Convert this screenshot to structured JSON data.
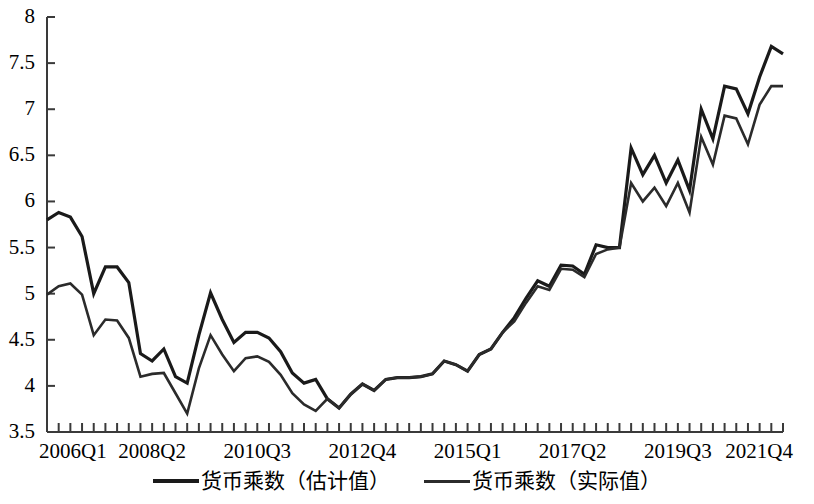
{
  "chart_data": {
    "type": "line",
    "title": "",
    "xlabel": "",
    "ylabel": "",
    "ylim": [
      3.5,
      8
    ],
    "ytick_labels": [
      "8",
      "7.5",
      "7",
      "6.5",
      "6",
      "5.5",
      "5",
      "4.5",
      "4",
      "3.5"
    ],
    "ytick_values": [
      8,
      7.5,
      7,
      6.5,
      6,
      5.5,
      5,
      4.5,
      4,
      3.5
    ],
    "grid": false,
    "legend_position": "bottom-center",
    "x": [
      "2006Q1",
      "2006Q2",
      "2006Q3",
      "2006Q4",
      "2007Q1",
      "2007Q2",
      "2007Q3",
      "2007Q4",
      "2008Q1",
      "2008Q2",
      "2008Q3",
      "2008Q4",
      "2009Q1",
      "2009Q2",
      "2009Q3",
      "2009Q4",
      "2010Q1",
      "2010Q2",
      "2010Q3",
      "2010Q4",
      "2011Q1",
      "2011Q2",
      "2011Q3",
      "2011Q4",
      "2012Q1",
      "2012Q2",
      "2012Q3",
      "2012Q4",
      "2013Q1",
      "2013Q2",
      "2013Q3",
      "2013Q4",
      "2014Q1",
      "2014Q2",
      "2014Q3",
      "2014Q4",
      "2015Q1",
      "2015Q2",
      "2015Q3",
      "2015Q4",
      "2016Q1",
      "2016Q2",
      "2016Q3",
      "2016Q4",
      "2017Q1",
      "2017Q2",
      "2017Q3",
      "2017Q4",
      "2018Q1",
      "2018Q2",
      "2018Q3",
      "2018Q4",
      "2019Q1",
      "2019Q2",
      "2019Q3",
      "2019Q4",
      "2020Q1",
      "2020Q2",
      "2020Q3",
      "2020Q4",
      "2021Q1",
      "2021Q2",
      "2021Q3",
      "2021Q4"
    ],
    "xtick_labels": [
      "2006Q1",
      "2008Q2",
      "2010Q3",
      "2012Q4",
      "2015Q1",
      "2017Q2",
      "2019Q3",
      "2021Q4"
    ],
    "xtick_indices": [
      0,
      9,
      18,
      27,
      36,
      45,
      54,
      63
    ],
    "series": [
      {
        "name": "货币乘数（估计值）",
        "color": "#1a1a1a",
        "width": 3.2,
        "values": [
          5.8,
          5.88,
          5.83,
          5.62,
          5.0,
          5.29,
          5.29,
          5.12,
          4.35,
          4.27,
          4.4,
          4.1,
          4.03,
          4.55,
          5.01,
          4.72,
          4.47,
          4.58,
          4.58,
          4.52,
          4.37,
          4.14,
          4.03,
          4.07,
          3.86,
          3.76,
          3.91,
          4.02,
          3.95,
          4.07,
          4.09,
          4.09,
          4.1,
          4.13,
          4.27,
          4.23,
          4.16,
          4.34,
          4.4,
          4.58,
          4.74,
          4.95,
          5.14,
          5.08,
          5.31,
          5.3,
          5.21,
          5.53,
          5.5,
          5.5,
          6.58,
          6.29,
          6.5,
          6.2,
          6.45,
          6.12,
          7.0,
          6.68,
          7.25,
          7.22,
          6.95,
          7.35,
          7.68,
          7.6
        ]
      },
      {
        "name": "货币乘数（实际值）",
        "color": "#2b2b2b",
        "width": 2.6,
        "values": [
          4.99,
          5.08,
          5.11,
          4.99,
          4.55,
          4.72,
          4.71,
          4.52,
          4.1,
          4.13,
          4.14,
          3.92,
          3.7,
          4.19,
          4.55,
          4.34,
          4.16,
          4.3,
          4.32,
          4.26,
          4.12,
          3.92,
          3.8,
          3.73,
          3.86,
          3.76,
          3.91,
          4.02,
          3.95,
          4.07,
          4.09,
          4.09,
          4.1,
          4.13,
          4.27,
          4.23,
          4.16,
          4.34,
          4.4,
          4.58,
          4.7,
          4.9,
          5.08,
          5.04,
          5.27,
          5.26,
          5.18,
          5.43,
          5.48,
          5.5,
          6.2,
          6.0,
          6.15,
          5.95,
          6.2,
          5.88,
          6.7,
          6.4,
          6.93,
          6.9,
          6.62,
          7.05,
          7.25,
          7.25
        ]
      }
    ]
  },
  "legend": {
    "entries": [
      {
        "label": "货币乘数（估计值）"
      },
      {
        "label": "货币乘数（实际值）"
      }
    ]
  }
}
